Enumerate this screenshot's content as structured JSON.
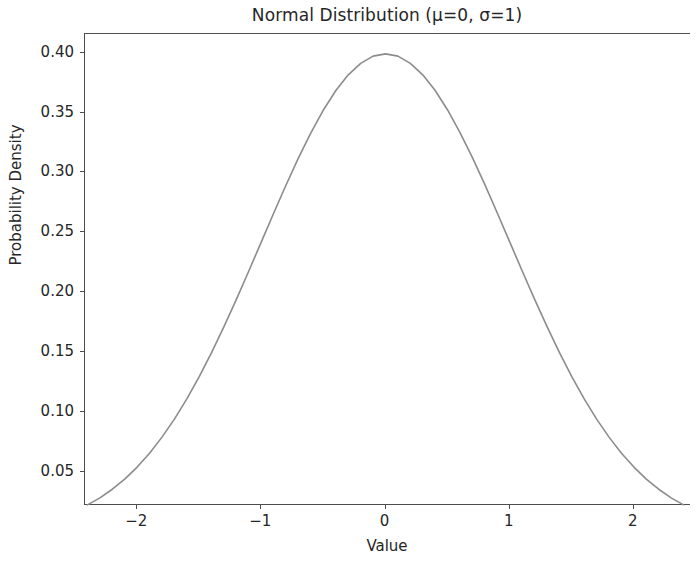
{
  "chart_data": {
    "type": "line",
    "title": "Normal Distribution (μ=0, σ=1)",
    "xlabel": "Value",
    "ylabel": "Probability Density",
    "grid": false,
    "legend": null,
    "line_color": "#8c8c8c",
    "line_width": 1.6,
    "xlim": [
      -2.42,
      2.46
    ],
    "ylim": [
      0.0215,
      0.4155
    ],
    "xticks": [
      -2,
      -1,
      0,
      1,
      2
    ],
    "xticklabels": [
      "−2",
      "−1",
      "0",
      "1",
      "2"
    ],
    "yticks": [
      0.05,
      0.1,
      0.15,
      0.2,
      0.25,
      0.3,
      0.35,
      0.4
    ],
    "yticklabels": [
      "0.05",
      "0.10",
      "0.15",
      "0.20",
      "0.25",
      "0.30",
      "0.35",
      "0.40"
    ],
    "series": [
      {
        "name": "Normal PDF",
        "mu": 0,
        "sigma": 1,
        "x": [
          -2.4,
          -2.3,
          -2.2,
          -2.1,
          -2.0,
          -1.9,
          -1.8,
          -1.7,
          -1.6,
          -1.5,
          -1.4,
          -1.3,
          -1.2,
          -1.1,
          -1.0,
          -0.9,
          -0.8,
          -0.7,
          -0.6,
          -0.5,
          -0.4,
          -0.3,
          -0.2,
          -0.1,
          0.0,
          0.1,
          0.2,
          0.3,
          0.4,
          0.5,
          0.6,
          0.7,
          0.8,
          0.9,
          1.0,
          1.1,
          1.2,
          1.3,
          1.4,
          1.5,
          1.6,
          1.7,
          1.8,
          1.9,
          2.0,
          2.1,
          2.2,
          2.3,
          2.4
        ],
        "y": [
          0.0224,
          0.0283,
          0.0355,
          0.044,
          0.054,
          0.0656,
          0.079,
          0.094,
          0.1109,
          0.1295,
          0.1497,
          0.1714,
          0.1942,
          0.2179,
          0.242,
          0.2661,
          0.2897,
          0.3123,
          0.3332,
          0.3521,
          0.3683,
          0.3814,
          0.391,
          0.397,
          0.3989,
          0.397,
          0.391,
          0.3814,
          0.3683,
          0.3521,
          0.3332,
          0.3123,
          0.2897,
          0.2661,
          0.242,
          0.2179,
          0.1942,
          0.1714,
          0.1497,
          0.1295,
          0.1109,
          0.094,
          0.079,
          0.0656,
          0.054,
          0.044,
          0.0355,
          0.0283,
          0.0224
        ]
      }
    ]
  },
  "figure": {
    "background": "#ffffff",
    "axis_color": "#4d4d4d",
    "text_color": "#262626"
  }
}
